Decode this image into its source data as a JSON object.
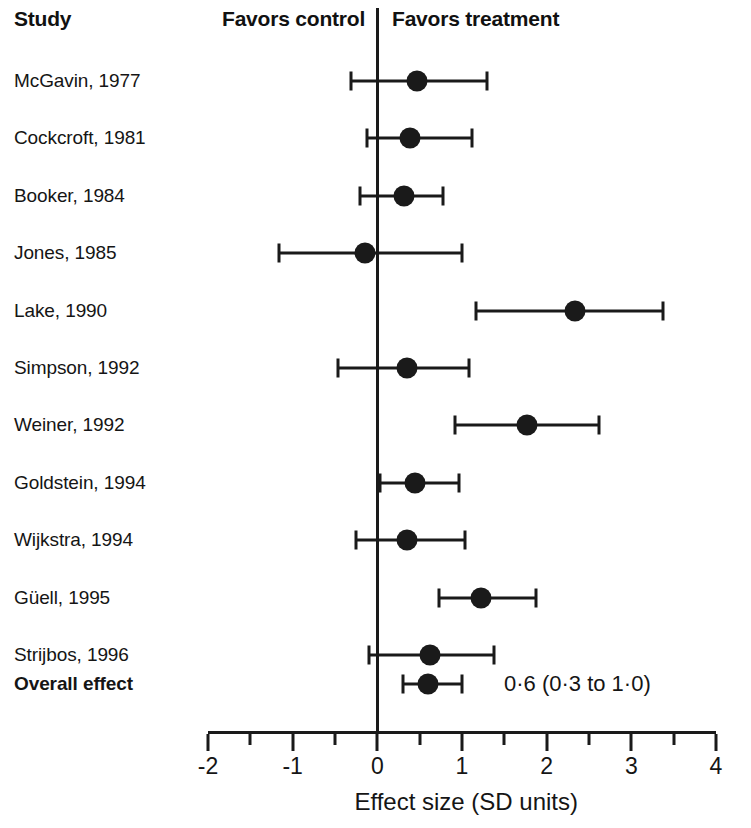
{
  "header": {
    "study_label": "Study",
    "favors_control": "Favors control",
    "favors_treatment": "Favors treatment"
  },
  "chart_data": {
    "type": "scatter",
    "subtype": "forest-plot",
    "title": "",
    "xlabel": "Effect size (SD units)",
    "ylabel": "",
    "xlim": [
      -2,
      4
    ],
    "xticks": [
      -2,
      -1,
      0,
      1,
      2,
      3,
      4
    ],
    "xtick_labels": [
      "-2",
      "-1",
      "0",
      "1",
      "2",
      "3",
      "4"
    ],
    "minor_tick_step": 0.5,
    "grid": false,
    "legend": "none",
    "reference_line": 0,
    "annotations": {
      "left_region": "Favors control",
      "right_region": "Favors treatment"
    },
    "categories": [
      "McGavin, 1977",
      "Cockcroft, 1981",
      "Booker, 1984",
      "Jones, 1985",
      "Lake, 1990",
      "Simpson, 1992",
      "Weiner, 1992",
      "Goldstein, 1994",
      "Wijkstra, 1994",
      "Güell, 1995",
      "Strijbos, 1996",
      "Overall effect"
    ],
    "studies": [
      {
        "label": "McGavin, 1977",
        "effect": 0.47,
        "ci_low": -0.31,
        "ci_high": 1.3,
        "bold": false
      },
      {
        "label": "Cockcroft, 1981",
        "effect": 0.38,
        "ci_low": -0.12,
        "ci_high": 1.12,
        "bold": false
      },
      {
        "label": "Booker, 1984",
        "effect": 0.32,
        "ci_low": -0.21,
        "ci_high": 0.78,
        "bold": false
      },
      {
        "label": "Jones, 1985",
        "effect": -0.14,
        "ci_low": -1.16,
        "ci_high": 1.0,
        "bold": false
      },
      {
        "label": "Lake, 1990",
        "effect": 2.34,
        "ci_low": 1.17,
        "ci_high": 3.37,
        "bold": false
      },
      {
        "label": "Simpson, 1992",
        "effect": 0.35,
        "ci_low": -0.47,
        "ci_high": 1.08,
        "bold": false
      },
      {
        "label": "Weiner, 1992",
        "effect": 1.77,
        "ci_low": 0.92,
        "ci_high": 2.62,
        "bold": false
      },
      {
        "label": "Goldstein, 1994",
        "effect": 0.45,
        "ci_low": 0.03,
        "ci_high": 0.97,
        "bold": false
      },
      {
        "label": "Wijkstra, 1994",
        "effect": 0.35,
        "ci_low": -0.25,
        "ci_high": 1.04,
        "bold": false
      },
      {
        "label": "Güell, 1995",
        "effect": 1.22,
        "ci_low": 0.73,
        "ci_high": 1.87,
        "bold": false
      },
      {
        "label": "Strijbos, 1996",
        "effect": 0.62,
        "ci_low": -0.1,
        "ci_high": 1.38,
        "bold": false
      },
      {
        "label": "Overall effect",
        "effect": 0.6,
        "ci_low": 0.3,
        "ci_high": 1.0,
        "bold": true,
        "annotation": "0·6 (0·3 to 1·0)"
      }
    ]
  }
}
